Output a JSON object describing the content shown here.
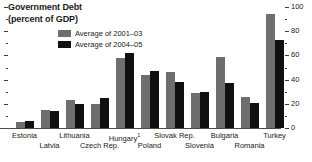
{
  "title": {
    "line1": "Government Debt",
    "line2": "(percent of GDP)"
  },
  "legend": {
    "items": [
      {
        "label": "Average of 2001–03",
        "color": "#6e6e6e",
        "key": "series-2001-03"
      },
      {
        "label": "Average of 2004–05",
        "color": "#101010",
        "key": "series-2004-05"
      }
    ]
  },
  "axis": {
    "ticks": [
      "0",
      "20",
      "40",
      "60",
      "80",
      "100"
    ],
    "min": 0,
    "max": 100,
    "position": "right"
  },
  "footnote_marker": "1",
  "chart_data": {
    "type": "bar",
    "title": "Government Debt (percent of GDP)",
    "xlabel": "",
    "ylabel": "percent of GDP",
    "ylim": [
      0,
      100
    ],
    "grid": false,
    "legend_position": "top-center",
    "categories": [
      "Estonia",
      "Latvia",
      "Lithuania",
      "Czech Rep.",
      "Hungary¹",
      "Poland",
      "Slovak Rep.",
      "Slovenia",
      "Bulgaria",
      "Romania",
      "Turkey"
    ],
    "series": [
      {
        "name": "Average of 2001–03",
        "color": "#6e6e6e",
        "values": [
          5,
          15,
          23,
          20,
          58,
          44,
          46,
          29,
          59,
          26,
          94
        ]
      },
      {
        "name": "Average of 2004–05",
        "color": "#101010",
        "values": [
          6,
          14,
          20,
          25,
          62,
          47,
          38,
          30,
          37,
          21,
          73
        ]
      }
    ]
  }
}
